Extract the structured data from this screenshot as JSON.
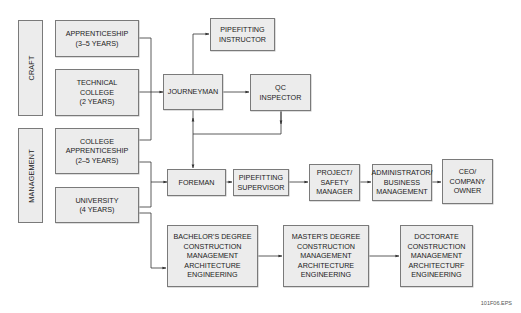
{
  "diagram": {
    "type": "career-path-flowchart",
    "groups": [
      {
        "id": "craft",
        "label": "CRAFT"
      },
      {
        "id": "management",
        "label": "MANAGEMENT"
      }
    ],
    "nodes": {
      "apprenticeship": "APPRENTICESHIP\n(3–5 YEARS)",
      "technical_college": "TECHNICAL\nCOLLEGE\n(2 YEARS)",
      "college_apprenticeship": "COLLEGE\nAPPRENTICESHIP\n(2–5 YEARS)",
      "university": "UNIVERSITY\n(4 YEARS)",
      "pipefitting_instructor": "PIPEFITTING\nINSTRUCTOR",
      "journeyman": "JOURNEYMAN",
      "qc_inspector": "QC\nINSPECTOR",
      "foreman": "FOREMAN",
      "pipefitting_supervisor": "PIPEFITTING\nSUPERVISOR",
      "project_safety_manager": "PROJECT/\nSAFETY\nMANAGER",
      "administrator": "ADMINISTRATOR/\nBUSINESS\nMANAGEMENT",
      "ceo": "CEO/\nCOMPANY\nOWNER",
      "bachelors": "BACHELOR'S DEGREE\nCONSTRUCTION\nMANAGEMENT\nARCHITECTURE\nENGINEERING",
      "masters": "MASTER'S DEGREE\nCONSTRUCTION\nMANAGEMENT\nARCHITECTURE\nENGINEERING",
      "doctorate": "DOCTORATE\nCONSTRUCTION\nMANAGEMENT\nARCHITECTURF\nENGINEERING"
    },
    "edges": [
      [
        "apprenticeship",
        "journeyman"
      ],
      [
        "technical_college",
        "journeyman"
      ],
      [
        "college_apprenticeship",
        "journeyman"
      ],
      [
        "journeyman",
        "pipefitting_instructor"
      ],
      [
        "journeyman",
        "qc_inspector"
      ],
      [
        "journeyman",
        "foreman"
      ],
      [
        "qc_inspector",
        "foreman"
      ],
      [
        "college_apprenticeship",
        "foreman"
      ],
      [
        "university",
        "foreman"
      ],
      [
        "university",
        "bachelors"
      ],
      [
        "foreman",
        "pipefitting_supervisor"
      ],
      [
        "pipefitting_supervisor",
        "project_safety_manager"
      ],
      [
        "project_safety_manager",
        "administrator"
      ],
      [
        "administrator",
        "ceo"
      ],
      [
        "bachelors",
        "masters"
      ],
      [
        "masters",
        "doctorate"
      ]
    ],
    "figure_id": "101F06.EPS",
    "colors": {
      "box_fill": "#ececec",
      "box_border": "#7a7a7a",
      "line": "#333333"
    }
  }
}
